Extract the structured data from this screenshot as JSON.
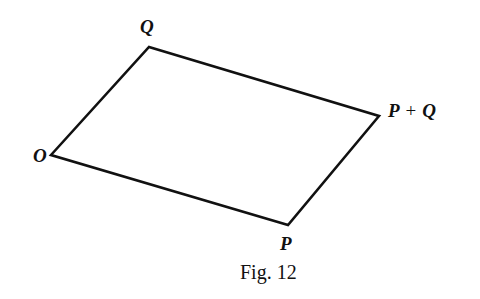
{
  "figure": {
    "caption": "Fig. 12",
    "stroke_color": "#111111",
    "background": "#ffffff",
    "vertices": {
      "O": {
        "label": "O",
        "x": 51,
        "y": 155
      },
      "Q": {
        "label": "Q",
        "x": 149,
        "y": 47
      },
      "PQ": {
        "label_left": "P",
        "label_op": "+",
        "label_right": "Q",
        "x": 379,
        "y": 116
      },
      "P": {
        "label": "P",
        "x": 288,
        "y": 225
      }
    },
    "edges": [
      {
        "from": "O",
        "to": "Q"
      },
      {
        "from": "Q",
        "to": "PQ"
      },
      {
        "from": "PQ",
        "to": "P"
      },
      {
        "from": "P",
        "to": "O"
      }
    ]
  }
}
